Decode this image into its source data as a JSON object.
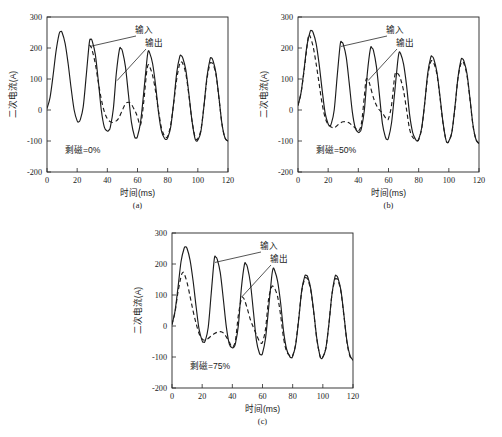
{
  "figure": {
    "panels": [
      {
        "id": "a",
        "tag": "(a)",
        "condition_label": "剩磁=0%",
        "annotations": {
          "input": "输入",
          "output": "输出"
        }
      },
      {
        "id": "b",
        "tag": "(b)",
        "condition_label": "剩磁=50%",
        "annotations": {
          "input": "输入",
          "output": "输出"
        }
      },
      {
        "id": "c",
        "tag": "(c)",
        "condition_label": "剩磁=75%",
        "annotations": {
          "input": "输入",
          "output": "输出"
        }
      }
    ]
  },
  "chart_data": [
    {
      "type": "line",
      "title": "",
      "panel": "(a)",
      "xlabel": "时间(ms)",
      "ylabel": "二次电流(A)",
      "xlim": [
        0,
        120
      ],
      "ylim": [
        -200,
        300
      ],
      "xticks": [
        0,
        20,
        40,
        60,
        80,
        100,
        120
      ],
      "yticks": [
        -200,
        -100,
        0,
        100,
        200,
        300
      ],
      "grid": false,
      "legend_position": "in-plot-annotation",
      "annotation": "剩磁=0%",
      "series": [
        {
          "name": "输入",
          "style": "solid",
          "color": "#1c1c1c",
          "x": [
            0,
            2,
            4,
            6,
            8,
            9,
            10,
            12,
            14,
            16,
            18,
            20,
            21,
            22,
            24,
            26,
            28,
            29,
            30,
            32,
            34,
            36,
            38,
            40,
            41,
            42,
            44,
            46,
            48,
            49,
            50,
            52,
            54,
            56,
            58,
            59,
            60,
            62,
            64,
            66,
            67,
            68,
            70,
            72,
            74,
            76,
            78,
            79,
            80,
            82,
            84,
            86,
            88,
            89,
            90,
            92,
            94,
            96,
            98,
            99,
            100,
            102,
            104,
            106,
            108,
            109,
            110,
            112,
            114,
            116,
            118,
            120
          ],
          "y": [
            5,
            40,
            110,
            190,
            245,
            253,
            250,
            215,
            150,
            70,
            0,
            -35,
            -38,
            -32,
            10,
            110,
            215,
            228,
            222,
            180,
            95,
            0,
            -55,
            -68,
            -65,
            -55,
            5,
            120,
            195,
            198,
            190,
            140,
            50,
            -40,
            -85,
            -90,
            -85,
            -40,
            50,
            150,
            188,
            185,
            150,
            80,
            -10,
            -70,
            -92,
            -95,
            -90,
            -55,
            25,
            120,
            172,
            175,
            168,
            130,
            55,
            -30,
            -90,
            -100,
            -97,
            -70,
            10,
            105,
            162,
            168,
            160,
            120,
            40,
            -45,
            -90,
            -100
          ]
        },
        {
          "name": "输出",
          "style": "dashed",
          "color": "#1c1c1c",
          "x": [
            28,
            29,
            30,
            32,
            34,
            36,
            38,
            40,
            42,
            44,
            46,
            47,
            48,
            50,
            52,
            54,
            56,
            58,
            59,
            60,
            62,
            64,
            66,
            67,
            68,
            70,
            72,
            74,
            76,
            78,
            79,
            80,
            82,
            84,
            86,
            88,
            89,
            90,
            92,
            94,
            96,
            98,
            99,
            100,
            102,
            104,
            106,
            108,
            109,
            110,
            112,
            114,
            116,
            118,
            120
          ],
          "y": [
            210,
            205,
            192,
            150,
            90,
            35,
            -5,
            -28,
            -38,
            -40,
            -35,
            -30,
            -22,
            0,
            20,
            25,
            18,
            0,
            -10,
            -22,
            -48,
            20,
            120,
            145,
            140,
            112,
            60,
            -5,
            -60,
            -85,
            -88,
            -85,
            -48,
            22,
            100,
            150,
            155,
            150,
            118,
            50,
            -30,
            -85,
            -95,
            -92,
            -65,
            10,
            98,
            148,
            152,
            148,
            115,
            38,
            -45,
            -90,
            -100
          ]
        }
      ]
    },
    {
      "type": "line",
      "title": "",
      "panel": "(b)",
      "xlabel": "时间(ms)",
      "ylabel": "二次电流(A)",
      "xlim": [
        0,
        120
      ],
      "ylim": [
        -200,
        300
      ],
      "xticks": [
        0,
        20,
        40,
        60,
        80,
        100,
        120
      ],
      "yticks": [
        -200,
        -100,
        0,
        100,
        200,
        300
      ],
      "grid": false,
      "legend_position": "in-plot-annotation",
      "annotation": "剩磁=50%",
      "series": [
        {
          "name": "输入",
          "style": "solid",
          "color": "#1c1c1c",
          "x": [
            0,
            2,
            4,
            6,
            8,
            9,
            10,
            12,
            14,
            16,
            18,
            20,
            21,
            22,
            24,
            26,
            28,
            29,
            30,
            32,
            34,
            36,
            38,
            40,
            41,
            42,
            44,
            46,
            48,
            49,
            50,
            52,
            54,
            56,
            58,
            59,
            60,
            62,
            64,
            66,
            67,
            68,
            70,
            72,
            74,
            76,
            78,
            79,
            80,
            82,
            84,
            86,
            88,
            89,
            90,
            92,
            94,
            96,
            98,
            99,
            100,
            102,
            104,
            106,
            108,
            109,
            110,
            112,
            114,
            116,
            118,
            120
          ],
          "y": [
            15,
            55,
            130,
            210,
            252,
            256,
            250,
            215,
            148,
            65,
            -10,
            -45,
            -50,
            -45,
            0,
            110,
            212,
            218,
            212,
            170,
            85,
            -5,
            -58,
            -72,
            -70,
            -60,
            0,
            120,
            198,
            200,
            192,
            140,
            48,
            -45,
            -88,
            -95,
            -90,
            -42,
            52,
            152,
            185,
            182,
            148,
            78,
            -15,
            -72,
            -95,
            -100,
            -95,
            -58,
            22,
            118,
            170,
            172,
            165,
            125,
            50,
            -35,
            -95,
            -105,
            -100,
            -72,
            8,
            102,
            160,
            165,
            158,
            118,
            38,
            -48,
            -95,
            -108
          ]
        },
        {
          "name": "输出",
          "style": "dashed",
          "color": "#1c1c1c",
          "x": [
            0,
            2,
            4,
            6,
            7,
            8,
            10,
            12,
            14,
            16,
            18,
            20,
            21,
            22,
            24,
            26,
            28,
            30,
            32,
            34,
            36,
            38,
            40,
            42,
            44,
            45,
            46,
            47,
            48,
            50,
            52,
            54,
            56,
            58,
            59,
            60,
            62,
            64,
            65,
            66,
            67,
            68,
            70,
            72,
            74,
            76,
            78,
            79,
            80,
            82,
            84,
            86,
            88,
            89,
            90,
            92,
            94,
            96,
            98,
            99,
            100,
            102,
            104,
            106,
            108,
            109,
            110,
            112,
            114,
            116,
            118,
            120
          ],
          "y": [
            15,
            55,
            125,
            205,
            240,
            238,
            205,
            150,
            85,
            20,
            -25,
            -48,
            -52,
            -55,
            -58,
            -50,
            -42,
            -38,
            -38,
            -42,
            -50,
            -58,
            -68,
            -45,
            45,
            95,
            100,
            92,
            75,
            40,
            15,
            0,
            -10,
            -25,
            -30,
            -28,
            15,
            105,
            122,
            118,
            112,
            100,
            62,
            0,
            -62,
            -88,
            -95,
            -98,
            -95,
            -60,
            20,
            110,
            155,
            158,
            152,
            118,
            45,
            -38,
            -95,
            -105,
            -100,
            -72,
            5,
            100,
            150,
            155,
            150,
            112,
            35,
            -50,
            -95,
            -108
          ]
        }
      ]
    },
    {
      "type": "line",
      "title": "",
      "panel": "(c)",
      "xlabel": "时间(ms)",
      "ylabel": "二次电流(A)",
      "xlim": [
        0,
        120
      ],
      "ylim": [
        -200,
        300
      ],
      "xticks": [
        0,
        20,
        40,
        60,
        80,
        100,
        120
      ],
      "yticks": [
        -200,
        -100,
        0,
        100,
        200,
        300
      ],
      "grid": false,
      "legend_position": "in-plot-annotation",
      "annotation": "剩磁=75%",
      "series": [
        {
          "name": "输入",
          "style": "solid",
          "color": "#1c1c1c",
          "x": [
            0,
            2,
            4,
            6,
            8,
            9,
            10,
            12,
            14,
            16,
            18,
            20,
            21,
            22,
            24,
            26,
            28,
            29,
            30,
            32,
            34,
            36,
            38,
            40,
            41,
            42,
            44,
            46,
            48,
            49,
            50,
            52,
            54,
            56,
            58,
            59,
            60,
            62,
            64,
            66,
            67,
            68,
            70,
            72,
            74,
            76,
            78,
            79,
            80,
            82,
            84,
            86,
            88,
            89,
            90,
            92,
            94,
            96,
            98,
            99,
            100,
            102,
            104,
            106,
            108,
            109,
            110,
            112,
            114,
            116,
            118,
            120
          ],
          "y": [
            5,
            48,
            125,
            208,
            250,
            255,
            250,
            212,
            145,
            62,
            -12,
            -48,
            -52,
            -48,
            -5,
            105,
            215,
            222,
            215,
            172,
            88,
            -2,
            -58,
            -70,
            -68,
            -58,
            2,
            122,
            198,
            200,
            190,
            138,
            45,
            -48,
            -88,
            -92,
            -88,
            -40,
            55,
            155,
            185,
            180,
            145,
            75,
            -18,
            -75,
            -98,
            -102,
            -98,
            -60,
            20,
            115,
            160,
            163,
            158,
            120,
            45,
            -40,
            -95,
            -105,
            -100,
            -72,
            5,
            100,
            158,
            162,
            155,
            115,
            35,
            -50,
            -95,
            -110
          ]
        },
        {
          "name": "输出",
          "style": "dashed",
          "color": "#1c1c1c",
          "x": [
            0,
            2,
            4,
            6,
            7,
            8,
            10,
            12,
            14,
            16,
            18,
            20,
            21,
            22,
            24,
            26,
            28,
            30,
            32,
            34,
            36,
            38,
            40,
            42,
            44,
            46,
            47,
            48,
            50,
            52,
            54,
            56,
            58,
            59,
            60,
            62,
            64,
            66,
            67,
            68,
            70,
            72,
            74,
            76,
            78,
            79,
            80,
            82,
            84,
            86,
            88,
            89,
            90,
            92,
            94,
            96,
            98,
            99,
            100,
            102,
            104,
            106,
            108,
            109,
            110,
            112,
            114,
            116,
            118,
            120
          ],
          "y": [
            5,
            45,
            110,
            160,
            172,
            170,
            140,
            95,
            48,
            8,
            -25,
            -42,
            -45,
            -45,
            -40,
            -32,
            -25,
            -20,
            -18,
            -22,
            -35,
            -52,
            -68,
            -48,
            35,
            88,
            92,
            85,
            55,
            20,
            -5,
            -28,
            -50,
            -55,
            -52,
            -10,
            85,
            125,
            128,
            122,
            95,
            35,
            -40,
            -82,
            -95,
            -98,
            -95,
            -58,
            25,
            112,
            152,
            155,
            150,
            115,
            42,
            -42,
            -95,
            -105,
            -100,
            -72,
            5,
            100,
            148,
            152,
            148,
            110,
            32,
            -52,
            -98,
            -110
          ]
        }
      ]
    }
  ]
}
